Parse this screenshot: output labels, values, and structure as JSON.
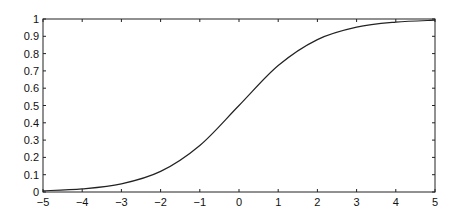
{
  "chart_data": {
    "type": "line",
    "title": "",
    "xlabel": "",
    "ylabel": "",
    "xlim": [
      -5,
      5
    ],
    "ylim": [
      0,
      1
    ],
    "grid": false,
    "legend": null,
    "x_ticks": [
      "−5",
      "−4",
      "−3",
      "−2",
      "−1",
      "0",
      "1",
      "2",
      "3",
      "4",
      "5"
    ],
    "y_ticks": [
      "0",
      "0.1",
      "0.2",
      "0.3",
      "0.4",
      "0.5",
      "0.6",
      "0.7",
      "0.8",
      "0.9",
      "1"
    ],
    "series": [
      {
        "name": "sigmoid",
        "color": "#222222",
        "x": [
          -5,
          -4,
          -3,
          -2,
          -1,
          0,
          1,
          2,
          3,
          4,
          5
        ],
        "y": [
          0.007,
          0.018,
          0.047,
          0.119,
          0.269,
          0.5,
          0.731,
          0.881,
          0.953,
          0.982,
          0.993
        ]
      }
    ]
  }
}
